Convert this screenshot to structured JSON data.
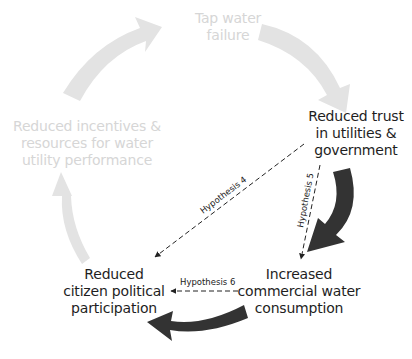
{
  "diagram": {
    "type": "causal-cycle",
    "colors": {
      "faded_arrow": "#e3e3e3",
      "faded_text": "#d6d6d6",
      "active_arrow": "#333333",
      "active_text": "#1e1e1e",
      "hypothesis_line": "#222222",
      "background": "#ffffff"
    },
    "nodes": [
      {
        "id": "tap-water-failure",
        "state": "faded",
        "lines": [
          "Tap water",
          "failure"
        ]
      },
      {
        "id": "reduced-trust",
        "state": "active",
        "lines": [
          "Reduced trust",
          "in utilities &",
          "government"
        ]
      },
      {
        "id": "increased-commercial-water",
        "state": "active",
        "lines": [
          "Increased",
          "commercial water",
          "consumption"
        ]
      },
      {
        "id": "reduced-citizen-participation",
        "state": "active",
        "lines": [
          "Reduced",
          "citizen political",
          "participation"
        ]
      },
      {
        "id": "reduced-incentives",
        "state": "faded",
        "lines": [
          "Reduced incentives &",
          "resources for water",
          "utility performance"
        ]
      }
    ],
    "cycle_arrows": [
      {
        "from": "reduced-incentives",
        "to": "tap-water-failure",
        "state": "faded"
      },
      {
        "from": "tap-water-failure",
        "to": "reduced-trust",
        "state": "faded"
      },
      {
        "from": "reduced-trust",
        "to": "increased-commercial-water",
        "state": "active"
      },
      {
        "from": "increased-commercial-water",
        "to": "reduced-citizen-participation",
        "state": "active"
      },
      {
        "from": "reduced-citizen-participation",
        "to": "reduced-incentives",
        "state": "faded"
      }
    ],
    "hypotheses": [
      {
        "label": "Hypothesis 4",
        "from": "reduced-trust",
        "to": "reduced-citizen-participation",
        "style": "dashed"
      },
      {
        "label": "Hypothesis 5",
        "from": "reduced-trust",
        "to": "increased-commercial-water",
        "style": "dashed"
      },
      {
        "label": "Hypothesis 6",
        "from": "increased-commercial-water",
        "to": "reduced-citizen-participation",
        "style": "dashed"
      }
    ]
  }
}
